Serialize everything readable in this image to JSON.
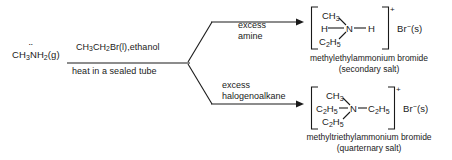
{
  "diagram": {
    "type": "chemical-reaction-scheme",
    "reactant": {
      "formula_html": "CH<sub>3</sub>NH<sub>2</sub>(g)",
      "plain": "CH3NH2(g)",
      "lone_pair": "̈"
    },
    "conditions": {
      "above_arrow_html": "CH<sub>3</sub>CH<sub>2</sub>Br(l),ethanol",
      "above_arrow_plain": "CH3CH2Br(l),ethanol",
      "below_arrow": "heat in a sealed tube"
    },
    "branches": [
      {
        "id": "upper",
        "label_line1": "excess",
        "label_line2": "amine",
        "product": {
          "charge": "+",
          "counter_ion_html": "Br<sup>−</sup>(s)",
          "counter_ion_plain": "Br-(s)",
          "top_group_html": "CH<sub>3</sub>",
          "left_group_html": "H",
          "center_atom": "N",
          "right_group_html": "H",
          "bottom_group_html": "C<sub>2</sub>H<sub>5</sub>",
          "name": "methylethylammonium bromide",
          "classification": "(secondary salt)"
        }
      },
      {
        "id": "lower",
        "label_line1": "excess",
        "label_line2": "halogenoalkane",
        "product": {
          "charge": "+",
          "counter_ion_html": "Br<sup>−</sup>(s)",
          "counter_ion_plain": "Br-(s)",
          "top_group_html": "CH<sub>3</sub>",
          "left_group_html": "C<sub>2</sub>H<sub>5</sub>",
          "center_atom": "N",
          "right_group_html": "C<sub>2</sub>H<sub>5</sub>",
          "bottom_group_html": "C<sub>2</sub>H<sub>5</sub>",
          "name": "methyltriethylammonium bromide",
          "classification": "(quarternary salt)"
        }
      }
    ],
    "colors": {
      "ink": "#1a1a1a",
      "background": "#ffffff"
    }
  }
}
